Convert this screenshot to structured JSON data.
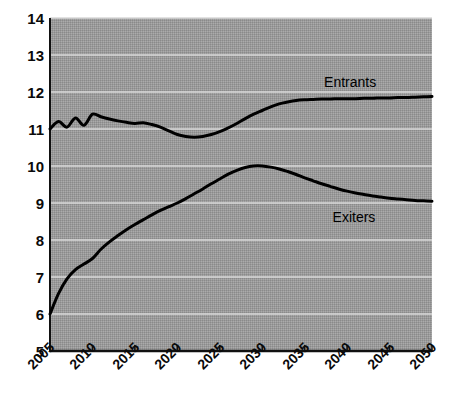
{
  "chart_data": {
    "type": "line",
    "title": "",
    "subtitle": "",
    "xlabel": "",
    "ylabel": "",
    "xlim": [
      2005,
      2050
    ],
    "ylim": [
      5,
      14
    ],
    "grid": true,
    "grid_axis": "y",
    "legend_position": "inline-right",
    "background_color": "#999999",
    "line_color": "#000000",
    "x_tick_labels": [
      "2005",
      "2010",
      "2015",
      "2020",
      "2025",
      "2030",
      "2035",
      "2040",
      "2045",
      "2050"
    ],
    "x_ticks": [
      2005,
      2010,
      2015,
      2020,
      2025,
      2030,
      2035,
      2040,
      2045,
      2050
    ],
    "y_tick_labels": [
      "14",
      "13",
      "12",
      "11",
      "10",
      "9",
      "8",
      "7",
      "6",
      "5"
    ],
    "y_ticks": [
      14,
      13,
      12,
      11,
      10,
      9,
      8,
      7,
      6,
      5
    ],
    "x": [
      2005,
      2006,
      2007,
      2008,
      2009,
      2010,
      2011,
      2012,
      2013,
      2014,
      2015,
      2016,
      2017,
      2018,
      2019,
      2020,
      2021,
      2022,
      2023,
      2024,
      2025,
      2026,
      2027,
      2028,
      2029,
      2030,
      2031,
      2032,
      2033,
      2034,
      2035,
      2036,
      2037,
      2038,
      2039,
      2040,
      2041,
      2042,
      2043,
      2044,
      2045,
      2046,
      2047,
      2048,
      2049,
      2050
    ],
    "series": [
      {
        "name": "Entrants",
        "label": "Entrants",
        "color": "#000000",
        "label_x": 2042,
        "label_y": 12.25,
        "values": [
          11.0,
          11.2,
          11.05,
          11.3,
          11.1,
          11.4,
          11.33,
          11.27,
          11.22,
          11.18,
          11.15,
          11.17,
          11.12,
          11.05,
          10.95,
          10.85,
          10.8,
          10.78,
          10.8,
          10.85,
          10.93,
          11.03,
          11.15,
          11.28,
          11.4,
          11.5,
          11.6,
          11.68,
          11.73,
          11.77,
          11.79,
          11.8,
          11.81,
          11.81,
          11.82,
          11.82,
          11.82,
          11.83,
          11.83,
          11.84,
          11.84,
          11.85,
          11.85,
          11.86,
          11.87,
          11.88
        ]
      },
      {
        "name": "Exiters",
        "label": "Exiters",
        "color": "#000000",
        "label_x": 2043,
        "label_y": 8.6,
        "values": [
          6.0,
          6.55,
          6.95,
          7.2,
          7.35,
          7.5,
          7.75,
          7.95,
          8.12,
          8.28,
          8.42,
          8.55,
          8.68,
          8.8,
          8.9,
          9.0,
          9.12,
          9.25,
          9.38,
          9.52,
          9.65,
          9.78,
          9.88,
          9.96,
          10.0,
          10.0,
          9.97,
          9.92,
          9.85,
          9.77,
          9.68,
          9.6,
          9.52,
          9.45,
          9.38,
          9.32,
          9.27,
          9.23,
          9.19,
          9.16,
          9.13,
          9.11,
          9.09,
          9.07,
          9.06,
          9.05
        ]
      }
    ]
  },
  "plot_geometry": {
    "left": 50,
    "top": 18,
    "right": 432,
    "bottom": 351
  }
}
